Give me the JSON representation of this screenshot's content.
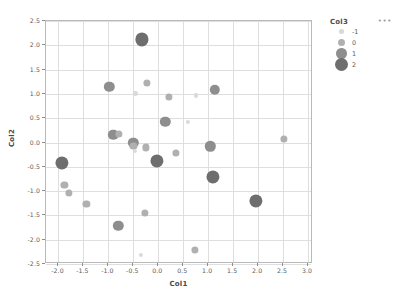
{
  "chart_data": {
    "type": "scatter",
    "title": "",
    "xlabel": "Col1",
    "ylabel": "Col2",
    "xlim": [
      -2.25,
      3.1
    ],
    "ylim": [
      -2.5,
      2.5
    ],
    "xticks": [
      "-2.0",
      "-1.5",
      "-1.0",
      "-0.5",
      "0.0",
      "0.5",
      "1.0",
      "1.5",
      "2.0",
      "2.5",
      "3.0"
    ],
    "xtick_values": [
      -2.0,
      -1.5,
      -1.0,
      -0.5,
      0.0,
      0.5,
      1.0,
      1.5,
      2.0,
      2.5,
      3.0
    ],
    "yticks": [
      "2.5",
      "2.0",
      "1.5",
      "1.0",
      "0.5",
      "0.0",
      "-0.5",
      "-1.0",
      "-1.5",
      "-2.0",
      "-2.5"
    ],
    "ytick_values": [
      2.5,
      2.0,
      1.5,
      1.0,
      0.5,
      0.0,
      -0.5,
      -1.0,
      -1.5,
      -2.0,
      -2.5
    ],
    "grid": true,
    "legend_position": "right",
    "size_encoding_field": "Col3",
    "points": [
      {
        "x": -0.33,
        "y": 2.12,
        "size": 2
      },
      {
        "x": -0.98,
        "y": 1.14,
        "size": 1
      },
      {
        "x": -0.23,
        "y": 1.23,
        "size": 0
      },
      {
        "x": -0.46,
        "y": 1.01,
        "size": -1
      },
      {
        "x": 0.22,
        "y": 0.94,
        "size": 0
      },
      {
        "x": 0.76,
        "y": 0.97,
        "size": -1
      },
      {
        "x": 1.13,
        "y": 1.09,
        "size": 1
      },
      {
        "x": 0.14,
        "y": 0.42,
        "size": 1
      },
      {
        "x": 0.6,
        "y": 0.43,
        "size": -1
      },
      {
        "x": -0.9,
        "y": 0.16,
        "size": 1
      },
      {
        "x": -0.79,
        "y": 0.18,
        "size": 0
      },
      {
        "x": 2.51,
        "y": 0.08,
        "size": 0
      },
      {
        "x": -0.5,
        "y": -0.01,
        "size": 1
      },
      {
        "x": -0.5,
        "y": -0.07,
        "size": 0
      },
      {
        "x": -0.47,
        "y": -0.18,
        "size": -1
      },
      {
        "x": -0.24,
        "y": -0.1,
        "size": 0
      },
      {
        "x": 0.35,
        "y": -0.21,
        "size": 0
      },
      {
        "x": 1.04,
        "y": -0.08,
        "size": 1
      },
      {
        "x": -0.02,
        "y": -0.38,
        "size": 2
      },
      {
        "x": -1.93,
        "y": -0.42,
        "size": 2
      },
      {
        "x": 1.09,
        "y": -0.71,
        "size": 2
      },
      {
        "x": -1.88,
        "y": -0.87,
        "size": 0
      },
      {
        "x": -1.79,
        "y": -1.03,
        "size": 0
      },
      {
        "x": -1.44,
        "y": -1.27,
        "size": 0
      },
      {
        "x": 1.96,
        "y": -1.21,
        "size": 2
      },
      {
        "x": -0.26,
        "y": -1.45,
        "size": 0
      },
      {
        "x": -0.8,
        "y": -1.72,
        "size": 1
      },
      {
        "x": 0.74,
        "y": -2.21,
        "size": 0
      },
      {
        "x": -0.35,
        "y": -2.31,
        "size": -1
      }
    ]
  },
  "legend": {
    "title": "Col3",
    "menu_label": "•••",
    "items": [
      {
        "label": "-1",
        "size": -1
      },
      {
        "label": "0",
        "size": 0
      },
      {
        "label": "1",
        "size": 1
      },
      {
        "label": "2",
        "size": 2
      }
    ]
  },
  "style": {
    "marker_colors": {
      "-1": "#d9d9d9",
      "0": "#b0b0b0",
      "1": "#8e8e8e",
      "2": "#6e6e6e"
    },
    "marker_radii": {
      "-1": 2.1,
      "0": 3.6,
      "1": 5.2,
      "2": 6.6
    },
    "grid_color": "#dedede",
    "frame_color": "#b9b9b9",
    "text_color": "#555555"
  }
}
